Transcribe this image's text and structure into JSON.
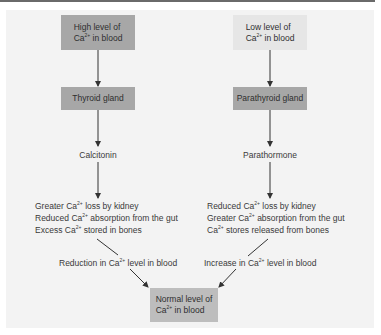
{
  "diagram": {
    "title": "",
    "colors": {
      "panel_bg": "#f3f3f3",
      "dark_box": "#a7a7a7",
      "light_box": "#e6e6e6",
      "normal_box": "#bdbdbd",
      "arrow": "#333333"
    },
    "left_branch": {
      "trigger": {
        "line1": "High level of",
        "ion": "Ca",
        "charge": "2+",
        "line2_rest": " in blood"
      },
      "gland": "Thyroid gland",
      "hormone": "Calcitonin",
      "effects": [
        {
          "pre": "Greater ",
          "ion": "Ca",
          "charge": "2+",
          "post": " loss by kidney"
        },
        {
          "pre": "Reduced ",
          "ion": "Ca",
          "charge": "2+",
          "post": " absorption from the gut"
        },
        {
          "pre": "Excess ",
          "ion": "Ca",
          "charge": "2+",
          "post": " stored in bones"
        }
      ],
      "result": {
        "pre": "Reduction in ",
        "ion": "Ca",
        "charge": "2+",
        "post": " level in blood"
      }
    },
    "right_branch": {
      "trigger": {
        "line1": "Low level of",
        "ion": "Ca",
        "charge": "2+",
        "line2_rest": " in blood"
      },
      "gland": "Parathyroid gland",
      "hormone": "Parathormone",
      "effects": [
        {
          "pre": "Reduced ",
          "ion": "Ca",
          "charge": "2+",
          "post": " loss by kidney"
        },
        {
          "pre": "Greater ",
          "ion": "Ca",
          "charge": "2+",
          "post": " absorption from the gut"
        },
        {
          "pre": "",
          "ion": "Ca",
          "charge": "2+",
          "post": " stores released from bones"
        }
      ],
      "result": {
        "pre": "Increase in ",
        "ion": "Ca",
        "charge": "2+",
        "post": " level in blood"
      }
    },
    "outcome": {
      "line1": "Normal level of",
      "ion": "Ca",
      "charge": "2+",
      "line2_rest": " in blood"
    }
  }
}
